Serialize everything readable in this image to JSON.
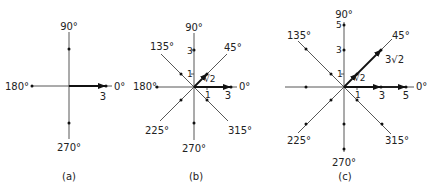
{
  "panels": [
    {
      "id": "a",
      "caption": "(a)",
      "angle_labels": {
        "0": "0°",
        "90": "90°",
        "180": "180°",
        "270": "270°"
      },
      "vector_label": "3",
      "tick_labels": []
    },
    {
      "id": "b",
      "caption": "(b)",
      "angle_labels": {
        "0": "0°",
        "45": "45°",
        "90": "90°",
        "135": "135°",
        "180": "180°",
        "225": "225°",
        "270": "270°",
        "315": "315°"
      },
      "vector_labels": {
        "horizontal": "3",
        "diagonal": "√2"
      },
      "tick_labels": {
        "x1": "1",
        "y1": "1",
        "y3": "3"
      }
    },
    {
      "id": "c",
      "caption": "(c)",
      "angle_labels": {
        "0": "0°",
        "45": "45°",
        "90": "90°",
        "135": "135°",
        "180": "180°",
        "225": "225°",
        "270": "270°",
        "315": "315°"
      },
      "vector_labels": {
        "horizontal_short": "3",
        "horizontal_long": "5",
        "diagonal_short": "√2",
        "diagonal_long": "3√2"
      },
      "tick_labels": {
        "x1": "1",
        "y1": "1",
        "y3": "3",
        "y5": "5"
      }
    }
  ]
}
